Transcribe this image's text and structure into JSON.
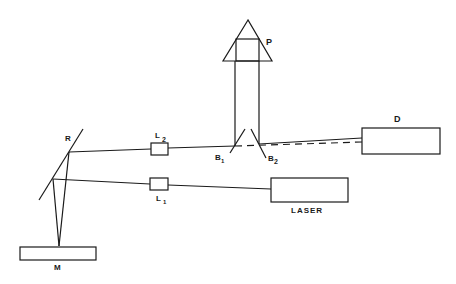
{
  "diagram": {
    "type": "optical-setup",
    "line_color": "#1a1a1a",
    "background": "#ffffff",
    "labels": {
      "prism": "P",
      "detector": "D",
      "laser": "LASER",
      "mirror_r": "R",
      "mirror_m": "M",
      "lens_1_base": "L",
      "lens_1_sub": "1",
      "lens_2_base": "L",
      "lens_2_sub": "2",
      "beamsplitter_1_base": "B",
      "beamsplitter_1_sub": "1",
      "beamsplitter_2_base": "B",
      "beamsplitter_2_sub": "2"
    }
  }
}
